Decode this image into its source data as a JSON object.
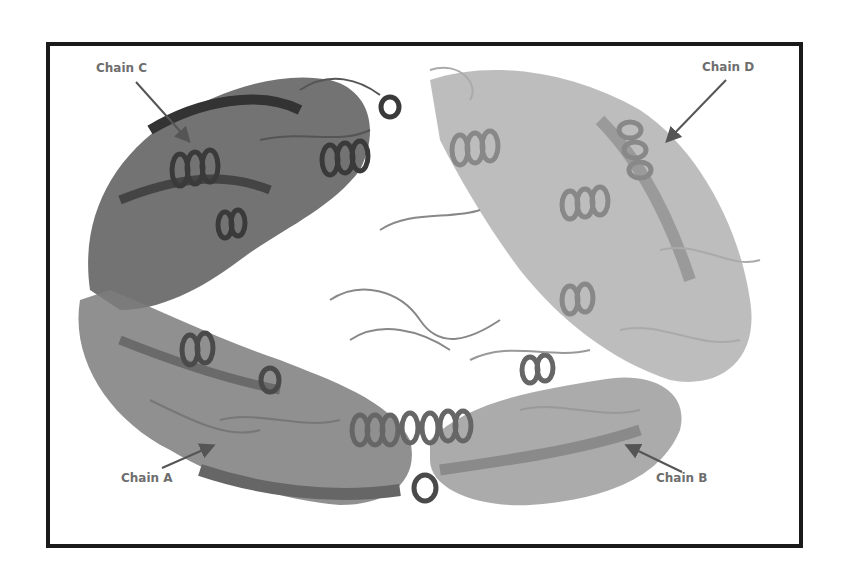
{
  "figure": {
    "border_color": "#1a1a1a",
    "label_color": "#6e6e6e",
    "labels": [
      {
        "id": "chain-c",
        "text": "Chain C"
      },
      {
        "id": "chain-d",
        "text": "Chain D"
      },
      {
        "id": "chain-a",
        "text": "Chain A"
      },
      {
        "id": "chain-b",
        "text": "Chain B"
      }
    ],
    "chains": [
      {
        "name": "Chain A",
        "position": "bottom-left",
        "shade": "#7a7a7a"
      },
      {
        "name": "Chain B",
        "position": "bottom-right",
        "shade": "#9a9a9a"
      },
      {
        "name": "Chain C",
        "position": "top-left",
        "shade": "#555555"
      },
      {
        "name": "Chain D",
        "position": "top-right",
        "shade": "#b0b0b0"
      }
    ]
  }
}
